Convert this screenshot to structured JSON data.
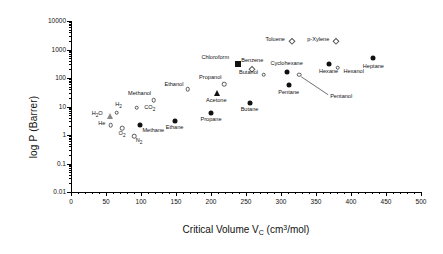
{
  "chart_data": {
    "type": "scatter",
    "title": "",
    "xlabel": "Critical Volume  V_C (cm3/mol)",
    "ylabel": "log P (Barrer)",
    "xlim": [
      0,
      500
    ],
    "ylim": [
      0.01,
      10000
    ],
    "yscale": "log",
    "grid": false,
    "legend": false,
    "xticks": [
      0,
      50,
      100,
      150,
      200,
      250,
      300,
      350,
      400,
      450,
      500
    ],
    "yticks": [
      0.01,
      0.1,
      1,
      10,
      100,
      1000,
      10000
    ],
    "xtick_labels": [
      "0",
      "50",
      "100",
      "150",
      "200",
      "250",
      "300",
      "350",
      "400",
      "450",
      "500"
    ],
    "ytick_labels": [
      "0.01",
      "0.1",
      "1",
      "10",
      "100",
      "1000",
      "10000"
    ],
    "x_axis_title_parts": {
      "main": "Critical Volume  V",
      "sub1": "C",
      "unit_pre": " (cm",
      "unit_sup": "3",
      "unit_post": "/mol)"
    },
    "points": [
      {
        "label": "H2O",
        "label_html": "H<sub>2</sub>O",
        "x": 56,
        "y": 4.5,
        "marker": "triangle-open",
        "label_dx": -13,
        "label_dy": -1
      },
      {
        "label": "H2",
        "label_html": "H<sub>2</sub>",
        "x": 65,
        "y": 6.0,
        "marker": "circle-open",
        "label_dx": 2,
        "label_dy": -7
      },
      {
        "label": "He",
        "label_html": "He",
        "x": 57,
        "y": 2.2,
        "marker": "circle-open",
        "label_dx": -9,
        "label_dy": -1
      },
      {
        "label": "O2",
        "label_html": "O<sub>2</sub>",
        "x": 73,
        "y": 1.7,
        "marker": "circle-open",
        "label_dx": 0,
        "label_dy": 7
      },
      {
        "label": "N2",
        "label_html": "N<sub>2</sub>",
        "x": 90,
        "y": 0.9,
        "marker": "circle-open",
        "label_dx": 5,
        "label_dy": 6
      },
      {
        "label": "CO2",
        "label_html": "CO<sub>2</sub>",
        "x": 94,
        "y": 9.0,
        "marker": "circle-open",
        "label_dx": 13,
        "label_dy": 1
      },
      {
        "label": "Methane",
        "label_html": "Methane",
        "x": 99,
        "y": 2.2,
        "marker": "circle-fill",
        "label_dx": 13,
        "label_dy": 6
      },
      {
        "label": "Methanol",
        "label_html": "Methanol",
        "x": 118,
        "y": 17,
        "marker": "circle-open",
        "label_dx": -14,
        "label_dy": -6
      },
      {
        "label": "Ethane",
        "label_html": "Ethane",
        "x": 148,
        "y": 3.0,
        "marker": "circle-fill",
        "label_dx": 0,
        "label_dy": 7
      },
      {
        "label": "Ethanol",
        "label_html": "Ethanol",
        "x": 167,
        "y": 40,
        "marker": "circle-open",
        "label_dx": -14,
        "label_dy": -4
      },
      {
        "label": "Propane",
        "label_html": "Propane",
        "x": 200,
        "y": 6.0,
        "marker": "circle-fill",
        "label_dx": 0,
        "label_dy": 7
      },
      {
        "label": "Acetone",
        "label_html": "Acetone",
        "x": 209,
        "y": 30,
        "marker": "triangle-fill",
        "label_dx": -1,
        "label_dy": 8
      },
      {
        "label": "Propanol",
        "label_html": "Propanol",
        "x": 219,
        "y": 60,
        "marker": "circle-open",
        "label_dx": -14,
        "label_dy": -6
      },
      {
        "label": "Butane",
        "label_html": "Butane",
        "x": 255,
        "y": 13,
        "marker": "circle-fill",
        "label_dx": 0,
        "label_dy": 7
      },
      {
        "label": "Chloroform",
        "label_html": "Chloroform",
        "x": 239,
        "y": 300,
        "marker": "square-fill",
        "label_dx": -23,
        "label_dy": -6
      },
      {
        "label": "Benzene",
        "label_html": "Benzene",
        "x": 259,
        "y": 200,
        "marker": "diamond-open",
        "label_dx": 0,
        "label_dy": -8
      },
      {
        "label": "Butanol",
        "label_html": "Butanol",
        "x": 275,
        "y": 130,
        "marker": "circle-open",
        "label_dx": -15,
        "label_dy": -2
      },
      {
        "label": "Cyclohexane",
        "label_html": "Cyclohexane",
        "x": 308,
        "y": 160,
        "marker": "circle-fill",
        "label_dx": 0,
        "label_dy": -8
      },
      {
        "label": "Pentane",
        "label_html": "Pentane",
        "x": 311,
        "y": 55,
        "marker": "circle-fill",
        "label_dx": 0,
        "label_dy": 8
      },
      {
        "label": "Toluene",
        "label_html": "Toluene",
        "x": 316,
        "y": 2000,
        "marker": "diamond-open",
        "label_dx": -17,
        "label_dy": -1
      },
      {
        "label": "Pentanol",
        "label_html": "Pentanol",
        "x": 326,
        "y": 130,
        "marker": "circle-open",
        "label_dx": 42,
        "label_dy": 22,
        "leader": true
      },
      {
        "label": "Hexane",
        "label_html": "Hexane",
        "x": 368,
        "y": 300,
        "marker": "circle-fill",
        "label_dx": 0,
        "label_dy": 8
      },
      {
        "label": "p-Xylene",
        "label_html": "p-Xylene",
        "x": 379,
        "y": 2000,
        "marker": "diamond-open",
        "label_dx": -18,
        "label_dy": -1
      },
      {
        "label": "Hexanol",
        "label_html": "Hexanol",
        "x": 381,
        "y": 230,
        "marker": "circle-open",
        "label_dx": 16,
        "label_dy": 4
      },
      {
        "label": "Heptane",
        "label_html": "Heptane",
        "x": 432,
        "y": 500,
        "marker": "circle-fill",
        "label_dx": 0,
        "label_dy": 9
      }
    ]
  }
}
